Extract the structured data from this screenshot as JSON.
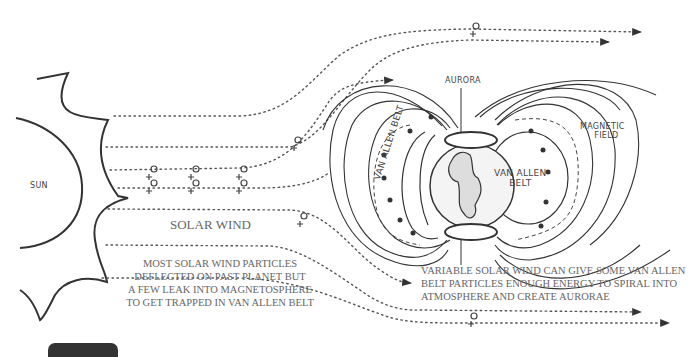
{
  "diagram": {
    "labels": {
      "sun": "SUN",
      "solar_wind": "SOLAR WIND",
      "aurora": "AURORA",
      "magnetic_field_line1": "MAGNETIC",
      "magnetic_field_line2": "FIELD",
      "van_allen_right_line1": "VAN ALLEN",
      "van_allen_right_line2": "BELT",
      "van_allen_left": "VAN ALLEN BELT"
    },
    "captions": {
      "left": [
        "MOST SOLAR WIND PARTICLES",
        "DEFLECTED ON PAST PLANET BUT",
        "A FEW LEAK INTO MAGNETOSPHERE",
        "TO GET TRAPPED IN VAN ALLEN BELT"
      ],
      "right": [
        "VARIABLE SOLAR WIND CAN GIVE SOME VAN ALLEN",
        "BELT PARTICLES ENOUGH ENERGY TO SPIRAL INTO",
        "ATMOSPHERE AND CREATE AURORAE"
      ]
    },
    "colors": {
      "ink": "#333333",
      "text": "#666666",
      "background": "#ffffff"
    }
  }
}
